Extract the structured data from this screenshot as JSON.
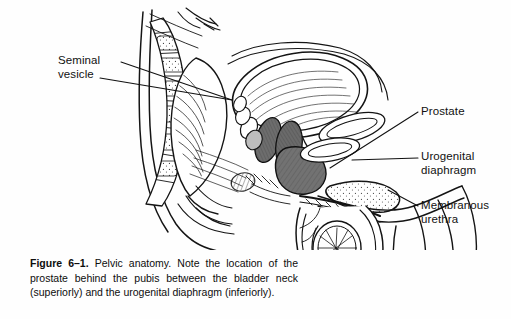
{
  "figure": {
    "title_prefix": "Figure 6–1.",
    "caption_body": " Pelvic anatomy. Note the location of the prostate behind the pubis between the bladder neck (superiorly) and the urogenital diaphragm (inferiorly).",
    "type": "medical-line-drawing",
    "colors": {
      "background": "#ffffff",
      "ink": "#111111",
      "shaded_organ_fill": "#6f6f6f",
      "light_shade": "#cfcfcf"
    },
    "labels": [
      {
        "id": "seminal-vesicle",
        "text": "Seminal\nvesicle",
        "side": "left"
      },
      {
        "id": "prostate",
        "text": "Prostate",
        "side": "right"
      },
      {
        "id": "urogenital-diaphragm",
        "text": "Urogenital\ndiaphragm",
        "side": "right"
      },
      {
        "id": "membranous-urethra",
        "text": "Membranous\nurethra",
        "side": "right"
      }
    ]
  }
}
